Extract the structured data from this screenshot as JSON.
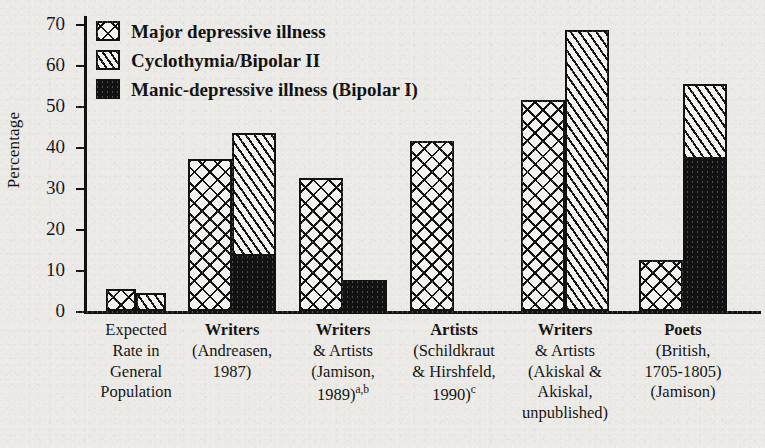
{
  "chart_data": {
    "type": "bar",
    "title": "",
    "xlabel": "",
    "ylabel": "Percentage",
    "ylim": [
      0,
      72
    ],
    "yticks": [
      0,
      10,
      20,
      30,
      40,
      50,
      60,
      70
    ],
    "grid": false,
    "legend_position": "top-left",
    "stacked": true,
    "categories": [
      "Expected Rate in General Population",
      "Writers (Andreasen, 1987)",
      "Writers & Artists (Jamison, 1989)a,b",
      "Artists (Schildkraut & Hirshfeld, 1990)c",
      "Writers & Artists (Akiskal & Akiskal, unpublished)",
      "Poets (British, 1705-1805) (Jamison)"
    ],
    "series": [
      {
        "name": "Major depressive illness",
        "values": [
          5,
          36.5,
          32,
          41,
          51,
          12
        ]
      },
      {
        "name": "Cyclothymia/Bipolar II",
        "values": [
          4,
          29.5,
          0,
          0,
          68,
          18
        ]
      },
      {
        "name": "Manic-depressive illness (Bipolar I)",
        "values": [
          0,
          13.5,
          7,
          0,
          0,
          37
        ]
      }
    ]
  },
  "legend": {
    "items": [
      {
        "label": "Major depressive illness",
        "pattern": "crosshatch",
        "color": "#121212"
      },
      {
        "label": "Cyclothymia/Bipolar II",
        "pattern": "diagonal-hatch",
        "color": "#121212"
      },
      {
        "label": "Manic-depressive illness (Bipolar I)",
        "pattern": "solid-black",
        "color": "#121212"
      }
    ]
  },
  "axis": {
    "y_label": "Percentage",
    "y_ticks": [
      "0",
      "10",
      "20",
      "30",
      "40",
      "50",
      "60",
      "70"
    ]
  },
  "x_labels": [
    {
      "title": "Expected",
      "lines": [
        "Rate in",
        "General",
        "Population"
      ],
      "bold_title": false,
      "sup": ""
    },
    {
      "title": "Writers",
      "lines": [
        "(Andreasen,",
        "1987)"
      ],
      "bold_title": true,
      "sup": ""
    },
    {
      "title": "Writers",
      "lines": [
        "& Artists",
        "(Jamison,",
        "1989)"
      ],
      "bold_title": true,
      "sup": "a,b"
    },
    {
      "title": "Artists",
      "lines": [
        "(Schildkraut",
        "& Hirshfeld,",
        "1990)"
      ],
      "bold_title": true,
      "sup": "c"
    },
    {
      "title": "Writers",
      "lines": [
        "& Artists",
        "(Akiskal &",
        "Akiskal,",
        "unpublished)"
      ],
      "bold_title": true,
      "sup": ""
    },
    {
      "title": "Poets",
      "lines": [
        "(British,",
        "1705-1805)",
        "(Jamison)"
      ],
      "bold_title": true,
      "sup": ""
    }
  ],
  "colors": {
    "ink": "#121212",
    "paper": "#eceae6",
    "bar_fill": "#f4f3f0"
  }
}
